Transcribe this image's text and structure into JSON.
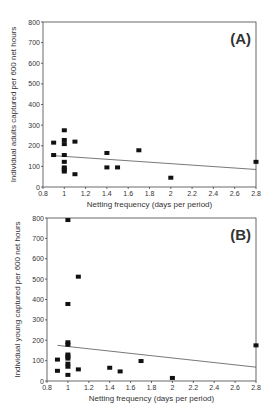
{
  "chart_data": [
    {
      "type": "scatter",
      "panel_label": "(A)",
      "title": "",
      "xlabel": "Netting frequency (days per period)",
      "ylabel": "Individual adults captured per 600 net hours",
      "xlim": [
        0.8,
        2.8
      ],
      "ylim": [
        0,
        800
      ],
      "xticks": [
        "0.8",
        "1",
        "1.2",
        "1.4",
        "1.6",
        "1.8",
        "2",
        "2.2",
        "2.4",
        "2.6",
        "2.8"
      ],
      "yticks": [
        "0",
        "100",
        "200",
        "300",
        "400",
        "500",
        "600",
        "700",
        "800"
      ],
      "grid": false,
      "legend": null,
      "points": [
        {
          "x": 0.9,
          "y": 215
        },
        {
          "x": 0.9,
          "y": 155
        },
        {
          "x": 1.0,
          "y": 275
        },
        {
          "x": 1.0,
          "y": 228
        },
        {
          "x": 1.0,
          "y": 208
        },
        {
          "x": 1.0,
          "y": 155
        },
        {
          "x": 1.0,
          "y": 122
        },
        {
          "x": 1.0,
          "y": 95
        },
        {
          "x": 1.0,
          "y": 85
        },
        {
          "x": 1.0,
          "y": 75
        },
        {
          "x": 1.1,
          "y": 220
        },
        {
          "x": 1.1,
          "y": 62
        },
        {
          "x": 1.4,
          "y": 165
        },
        {
          "x": 1.4,
          "y": 95
        },
        {
          "x": 1.5,
          "y": 95
        },
        {
          "x": 1.7,
          "y": 178
        },
        {
          "x": 2.0,
          "y": 45
        },
        {
          "x": 2.8,
          "y": 122
        }
      ],
      "trendline": {
        "x": [
          0.9,
          2.8
        ],
        "y": [
          152,
          85
        ]
      }
    },
    {
      "type": "scatter",
      "panel_label": "(B)",
      "title": "",
      "xlabel": "Netting frequency (days per period)",
      "ylabel": "Individual young captured per 600 net hours",
      "xlim": [
        0.8,
        2.8
      ],
      "ylim": [
        0,
        800
      ],
      "xticks": [
        "0.8",
        "1",
        "1.2",
        "1.4",
        "1.6",
        "1.8",
        "2",
        "2.2",
        "2.4",
        "2.6",
        "2.8"
      ],
      "yticks": [
        "0",
        "100",
        "200",
        "300",
        "400",
        "500",
        "600",
        "700",
        "800"
      ],
      "grid": false,
      "legend": null,
      "points": [
        {
          "x": 0.9,
          "y": 105
        },
        {
          "x": 0.9,
          "y": 50
        },
        {
          "x": 1.0,
          "y": 790
        },
        {
          "x": 1.0,
          "y": 378
        },
        {
          "x": 1.0,
          "y": 190
        },
        {
          "x": 1.0,
          "y": 178
        },
        {
          "x": 1.0,
          "y": 130
        },
        {
          "x": 1.0,
          "y": 120
        },
        {
          "x": 1.0,
          "y": 110
        },
        {
          "x": 1.0,
          "y": 85
        },
        {
          "x": 1.0,
          "y": 70
        },
        {
          "x": 1.0,
          "y": 30
        },
        {
          "x": 1.1,
          "y": 512
        },
        {
          "x": 1.1,
          "y": 57
        },
        {
          "x": 1.4,
          "y": 65
        },
        {
          "x": 1.5,
          "y": 47
        },
        {
          "x": 1.7,
          "y": 98
        },
        {
          "x": 2.0,
          "y": 15
        },
        {
          "x": 2.8,
          "y": 175
        }
      ],
      "trendline": {
        "x": [
          0.9,
          2.8
        ],
        "y": [
          175,
          68
        ]
      }
    }
  ]
}
